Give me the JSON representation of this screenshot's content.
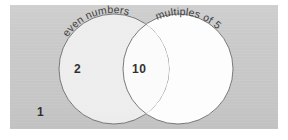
{
  "diagram": {
    "sets": [
      {
        "id": "even-numbers",
        "label": "even numbers",
        "position": "left",
        "fill": "#f0f0f0",
        "stroke": "#6a6a6a"
      },
      {
        "id": "multiples-of-5",
        "label": "multiples of 5",
        "position": "right",
        "fill": "#fdfdfd",
        "stroke": "#6a6a6a"
      }
    ],
    "regions": {
      "left_only": {
        "name": "even numbers only",
        "value": "2"
      },
      "intersection": {
        "name": "even numbers and multiples of 5",
        "value": "10"
      },
      "right_only": {
        "name": "multiples of 5 only",
        "value": ""
      },
      "outside": {
        "name": "outside both sets",
        "value": "1"
      }
    },
    "colors": {
      "paper": "#c9c9c9",
      "page": "#ffffff",
      "ink": "#2e2e2e",
      "outline": "#6a6a6a"
    }
  }
}
